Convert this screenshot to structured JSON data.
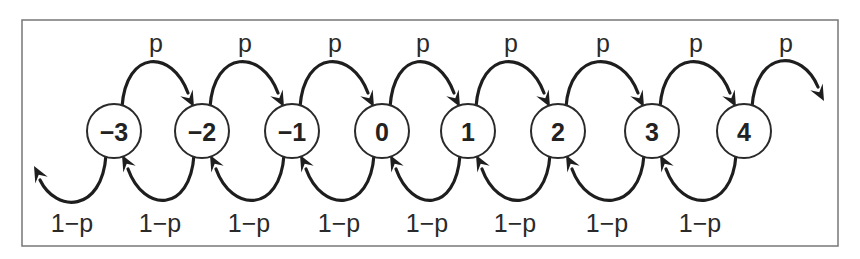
{
  "diagram": {
    "type": "random-walk-markov-chain",
    "states": [
      "−3",
      "−2",
      "−1",
      "0",
      "1",
      "2",
      "3",
      "4"
    ],
    "forward_label": "p",
    "backward_label": "1−p",
    "forward_transitions": [
      {
        "from": "−3",
        "to": "−2",
        "label": "p"
      },
      {
        "from": "−2",
        "to": "−1",
        "label": "p"
      },
      {
        "from": "−1",
        "to": "0",
        "label": "p"
      },
      {
        "from": "0",
        "to": "1",
        "label": "p"
      },
      {
        "from": "1",
        "to": "2",
        "label": "p"
      },
      {
        "from": "2",
        "to": "3",
        "label": "p"
      },
      {
        "from": "3",
        "to": "4",
        "label": "p"
      },
      {
        "from": "4",
        "to": "…",
        "label": "p"
      }
    ],
    "backward_transitions": [
      {
        "from": "−3",
        "to": "…",
        "label": "1−p"
      },
      {
        "from": "−2",
        "to": "−3",
        "label": "1−p"
      },
      {
        "from": "−1",
        "to": "−2",
        "label": "1−p"
      },
      {
        "from": "0",
        "to": "−1",
        "label": "1−p"
      },
      {
        "from": "1",
        "to": "0",
        "label": "1−p"
      },
      {
        "from": "2",
        "to": "1",
        "label": "1−p"
      },
      {
        "from": "3",
        "to": "2",
        "label": "1−p"
      },
      {
        "from": "4",
        "to": "3",
        "label": "1−p"
      }
    ],
    "colors": {
      "stroke": "#1e1e1e",
      "background": "#ffffff",
      "frame": "#777777"
    }
  }
}
